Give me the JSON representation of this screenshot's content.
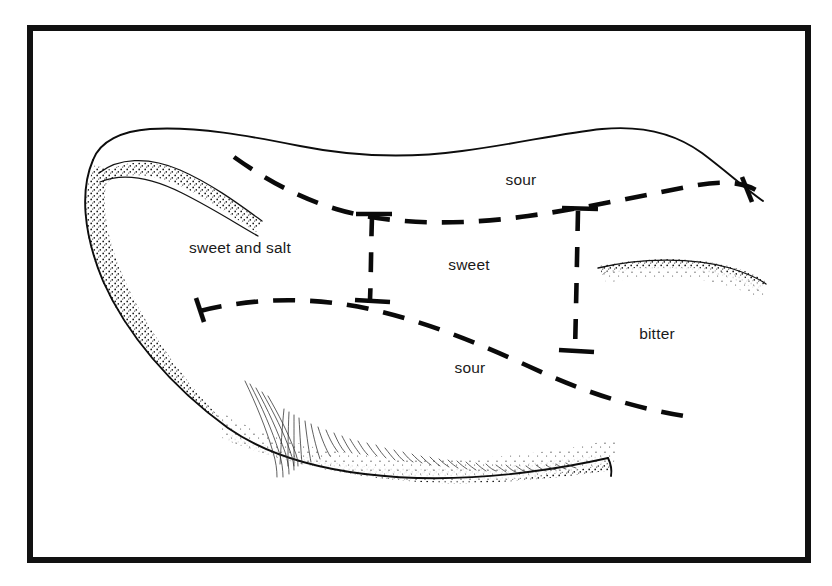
{
  "figure": {
    "type": "anatomical-line-illustration",
    "background_color": "#ffffff",
    "ink_color": "#0d0d0d",
    "frame": {
      "name": "border-frame",
      "x": 27,
      "y": 25,
      "width": 784,
      "height": 538,
      "stroke_width": 6,
      "color": "#111111"
    },
    "labels": [
      {
        "id": "sour-upper",
        "text": "sour",
        "x": 521,
        "y": 185,
        "anchor": "middle"
      },
      {
        "id": "sweet-and-salt",
        "text": "sweet and salt",
        "x": 240,
        "y": 253,
        "anchor": "middle"
      },
      {
        "id": "sweet",
        "text": "sweet",
        "x": 469,
        "y": 270,
        "anchor": "middle"
      },
      {
        "id": "bitter",
        "text": "bitter",
        "x": 657,
        "y": 339,
        "anchor": "middle"
      },
      {
        "id": "sour-lower",
        "text": "sour",
        "x": 470,
        "y": 373,
        "anchor": "middle"
      }
    ],
    "regions": [
      "sour",
      "sweet and salt",
      "sweet",
      "bitter",
      "sour"
    ],
    "dash_pattern": "20 14",
    "label_font_size_px": 15.5
  }
}
